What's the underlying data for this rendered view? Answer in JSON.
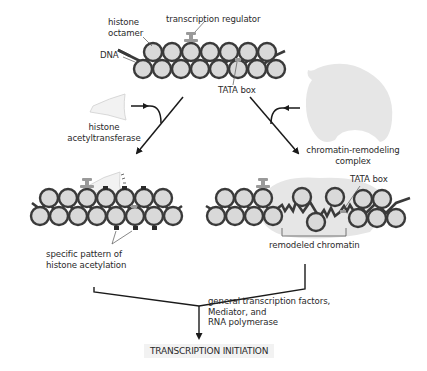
{
  "figure": {
    "colors": {
      "nucleosome_fill": "#d9d9d9",
      "nucleosome_stroke": "#3a3a3a",
      "protein_fill": "#e6e6e6",
      "line": "#1a1a1a",
      "text": "#2a2a2a",
      "final_box": "#f2f2f2"
    }
  },
  "labels": {
    "histone_octamer": "histone\noctamer",
    "transcription_regulator": "transcription regulator",
    "dna": "DNA",
    "tata_box_top": "TATA box",
    "histone_acetyltransferase": "histone\nacetyltransferase",
    "chromatin_remodeling_complex": "chromatin-remodeling\ncomplex",
    "tata_box_right": "TATA box",
    "specific_pattern": "specific pattern of\nhistone acetylation",
    "remodeled_chromatin": "remodeled chromatin",
    "general_factors": "general transcription factors,\nMediator, and\nRNA polymerase",
    "transcription_initiation": "TRANSCRIPTION INITIATION"
  }
}
